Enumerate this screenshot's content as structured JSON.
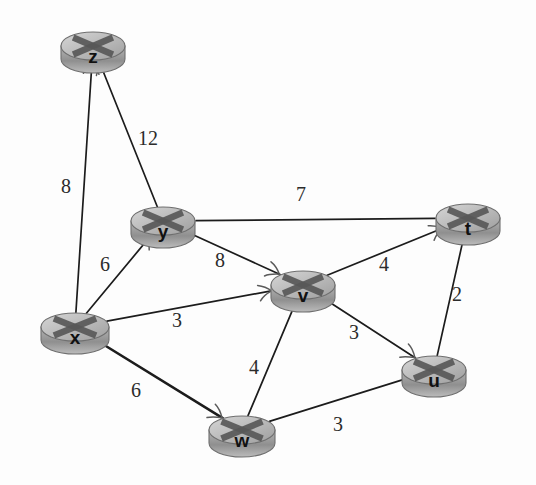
{
  "diagram": {
    "type": "undirected-weighted-graph",
    "background_color": "#fdfdfd",
    "edge_color": "#1c1c1c",
    "node_fill_color": "#b8b8b8",
    "node_stroke_color": "#6f6f6f",
    "label_color": "#2b2b2b"
  },
  "nodes": [
    {
      "id": "z",
      "label": "z",
      "cx": 93,
      "cy": 46,
      "rx": 32,
      "ry": 14,
      "depth": 13
    },
    {
      "id": "y",
      "label": "y",
      "cx": 163,
      "cy": 221,
      "rx": 32,
      "ry": 14,
      "depth": 13
    },
    {
      "id": "x",
      "label": "x",
      "cx": 75,
      "cy": 327,
      "rx": 34,
      "ry": 14,
      "depth": 13
    },
    {
      "id": "v",
      "label": "v",
      "cx": 303,
      "cy": 285,
      "rx": 32,
      "ry": 14,
      "depth": 13
    },
    {
      "id": "t",
      "label": "t",
      "cx": 468,
      "cy": 218,
      "rx": 32,
      "ry": 14,
      "depth": 13
    },
    {
      "id": "u",
      "label": "u",
      "cx": 434,
      "cy": 370,
      "rx": 32,
      "ry": 14,
      "depth": 13
    },
    {
      "id": "w",
      "label": "w",
      "cx": 242,
      "cy": 430,
      "rx": 33,
      "ry": 14,
      "depth": 13
    }
  ],
  "edges": [
    {
      "id": "x-z",
      "from": "x",
      "to": "z",
      "weight": "8",
      "label_x": 66,
      "label_y": 188,
      "arrow_at": "z",
      "thick": false
    },
    {
      "id": "y-z",
      "from": "y",
      "to": "z",
      "weight": "12",
      "label_x": 148,
      "label_y": 140,
      "arrow_at": "z",
      "thick": false
    },
    {
      "id": "x-y",
      "from": "x",
      "to": "y",
      "weight": "6",
      "label_x": 105,
      "label_y": 266,
      "arrow_at": "y",
      "thick": false
    },
    {
      "id": "y-t",
      "from": "y",
      "to": "t",
      "weight": "7",
      "label_x": 301,
      "label_y": 196,
      "arrow_at": "none",
      "thick": false
    },
    {
      "id": "y-v",
      "from": "y",
      "to": "v",
      "weight": "8",
      "label_x": 220,
      "label_y": 262,
      "arrow_at": "v",
      "thick": false
    },
    {
      "id": "x-v",
      "from": "x",
      "to": "v",
      "weight": "3",
      "label_x": 177,
      "label_y": 322,
      "arrow_at": "v",
      "thick": false
    },
    {
      "id": "v-t",
      "from": "v",
      "to": "t",
      "weight": "4",
      "label_x": 384,
      "label_y": 266,
      "arrow_at": "t",
      "thick": false
    },
    {
      "id": "t-u",
      "from": "t",
      "to": "u",
      "weight": "2",
      "label_x": 457,
      "label_y": 296,
      "arrow_at": "none",
      "thick": false
    },
    {
      "id": "v-u",
      "from": "v",
      "to": "u",
      "weight": "3",
      "label_x": 354,
      "label_y": 334,
      "arrow_at": "u",
      "thick": false
    },
    {
      "id": "v-w",
      "from": "v",
      "to": "w",
      "weight": "4",
      "label_x": 254,
      "label_y": 369,
      "arrow_at": "none",
      "thick": false
    },
    {
      "id": "x-w",
      "from": "x",
      "to": "w",
      "weight": "6",
      "label_x": 136,
      "label_y": 392,
      "arrow_at": "w",
      "thick": true
    },
    {
      "id": "w-u",
      "from": "w",
      "to": "u",
      "weight": "3",
      "label_x": 338,
      "label_y": 426,
      "arrow_at": "none",
      "thick": false
    }
  ],
  "icons": {
    "router": "router-icon",
    "arrowhead": "arrowhead-icon"
  }
}
